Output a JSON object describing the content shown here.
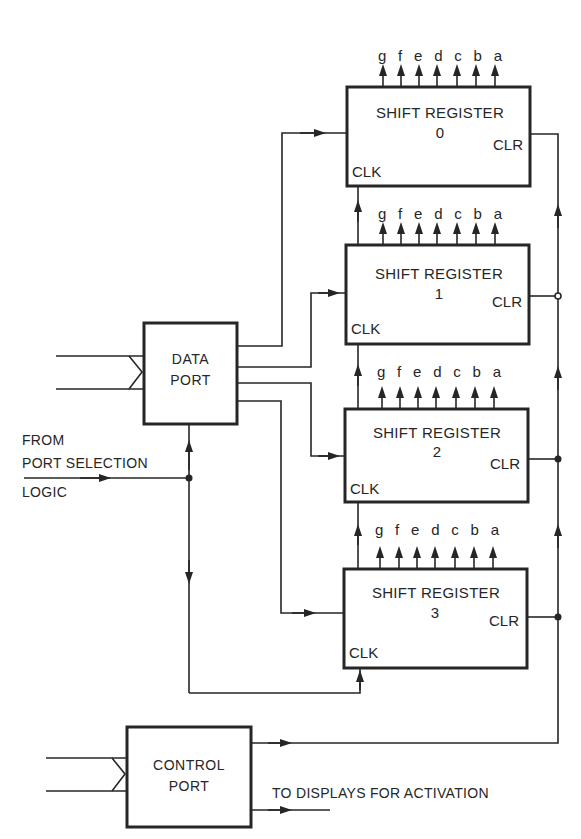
{
  "diagram": {
    "colors": {
      "line": "#262626",
      "background": "#ffffff"
    },
    "shift_registers": [
      {
        "title": "SHIFT REGISTER",
        "number": "0",
        "clk_label": "CLK",
        "clr_label": "CLR",
        "outputs": [
          "g",
          "f",
          "e",
          "d",
          "c",
          "b",
          "a"
        ]
      },
      {
        "title": "SHIFT REGISTER",
        "number": "1",
        "clk_label": "CLK",
        "clr_label": "CLR",
        "outputs": [
          "g",
          "f",
          "e",
          "d",
          "c",
          "b",
          "a"
        ]
      },
      {
        "title": "SHIFT REGISTER",
        "number": "2",
        "clk_label": "CLK",
        "clr_label": "CLR",
        "outputs": [
          "g",
          "f",
          "e",
          "d",
          "c",
          "b",
          "a"
        ]
      },
      {
        "title": "SHIFT REGISTER",
        "number": "3",
        "clk_label": "CLK",
        "clr_label": "CLR",
        "outputs": [
          "g",
          "f",
          "e",
          "d",
          "c",
          "b",
          "a"
        ]
      }
    ],
    "data_port": {
      "line1": "DATA",
      "line2": "PORT"
    },
    "control_port": {
      "line1": "CONTROL",
      "line2": "PORT"
    },
    "annotations": {
      "from_line1": "FROM",
      "from_line2": "PORT SELECTION",
      "from_line3": "LOGIC",
      "to_displays": "TO DISPLAYS FOR ACTIVATION"
    }
  }
}
